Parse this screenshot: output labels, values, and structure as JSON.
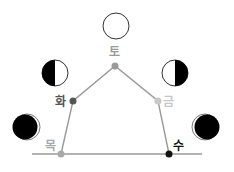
{
  "diagram": {
    "nodes": [
      {
        "id": "to",
        "label": "토",
        "color": "#999999",
        "x": 115,
        "y": 66,
        "label_x": 110,
        "label_y": 55,
        "moon": "full"
      },
      {
        "id": "hwa",
        "label": "화",
        "color": "#555555",
        "x": 73,
        "y": 101,
        "label_x": 55,
        "label_y": 106,
        "moon": "first-quarter-dark-left"
      },
      {
        "id": "geum",
        "label": "금",
        "color": "#c8c8c8",
        "x": 158,
        "y": 101,
        "label_x": 163,
        "label_y": 106,
        "moon": "last-quarter-dark-right"
      },
      {
        "id": "mok",
        "label": "목",
        "color": "#a8a8a8",
        "x": 61,
        "y": 154,
        "label_x": 45,
        "label_y": 150,
        "moon": "waxing-crescent"
      },
      {
        "id": "su",
        "label": "수",
        "color": "#111111",
        "x": 169,
        "y": 154,
        "label_x": 173,
        "label_y": 150,
        "moon": "waning-crescent"
      }
    ],
    "baseline": {
      "x1": 32,
      "x2": 202,
      "y": 154,
      "color": "#999999"
    },
    "edge_color": "#9a9a9a",
    "moons": [
      {
        "name": "full-moon",
        "cx": 116,
        "cy": 26,
        "r": 13
      },
      {
        "name": "half-moon-dark-left",
        "cx": 55,
        "cy": 73,
        "r": 13
      },
      {
        "name": "half-moon-dark-right",
        "cx": 175,
        "cy": 73,
        "r": 13
      },
      {
        "name": "crescent-lit-right",
        "cx": 26,
        "cy": 127,
        "r": 13
      },
      {
        "name": "crescent-lit-left",
        "cx": 206,
        "cy": 127,
        "r": 13
      }
    ]
  }
}
